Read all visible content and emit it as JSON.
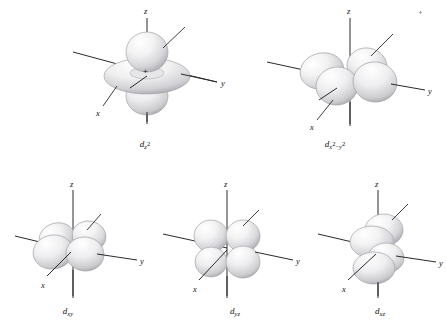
{
  "figure": {
    "title": "",
    "background_color": "#ffffff",
    "lobe_fill_light": "#fdfdfd",
    "lobe_fill_mid": "#e2e2e4",
    "lobe_fill_dark": "#b9b9bd",
    "lobe_outline": "#9a9a9f",
    "axis_color": "#2a2a2a",
    "label_color": "#141414",
    "axis_names": {
      "z": "z",
      "y": "y",
      "x": "x"
    },
    "orbitals": [
      {
        "id": "dz2",
        "label_d": "d",
        "label_sub": "z",
        "label_sup": "2",
        "label_plain": "dz2",
        "shape": "two-lobes-plus-torus",
        "axes": [
          "z",
          "y",
          "x"
        ],
        "has_plus_sign": true,
        "plus_sign": "+"
      },
      {
        "id": "dx2-y2",
        "label_d": "d",
        "label_sub_a": "x",
        "label_sup_a": "2",
        "label_op": "−",
        "label_sub_b": "y",
        "label_sup_b": "2",
        "label_plain": "dx2-y2",
        "shape": "four-lobes-on-axes",
        "axes": [
          "z",
          "y",
          "x"
        ],
        "has_plus_sign": false
      },
      {
        "id": "dxy",
        "label_d": "d",
        "label_sub": "xy",
        "label_plain": "dxy",
        "shape": "four-lobes-between-axes",
        "axes": [
          "z",
          "y",
          "x"
        ],
        "has_plus_sign": false
      },
      {
        "id": "dyz",
        "label_d": "d",
        "label_sub": "yz",
        "label_plain": "dyz",
        "shape": "four-lobes-between-axes",
        "axes": [
          "z",
          "y",
          "x"
        ],
        "has_plus_sign": false
      },
      {
        "id": "dxz",
        "label_d": "d",
        "label_sub": "xz",
        "label_plain": "dxz",
        "shape": "four-lobes-between-axes",
        "axes": [
          "z",
          "y",
          "x"
        ],
        "has_plus_sign": false
      }
    ]
  }
}
